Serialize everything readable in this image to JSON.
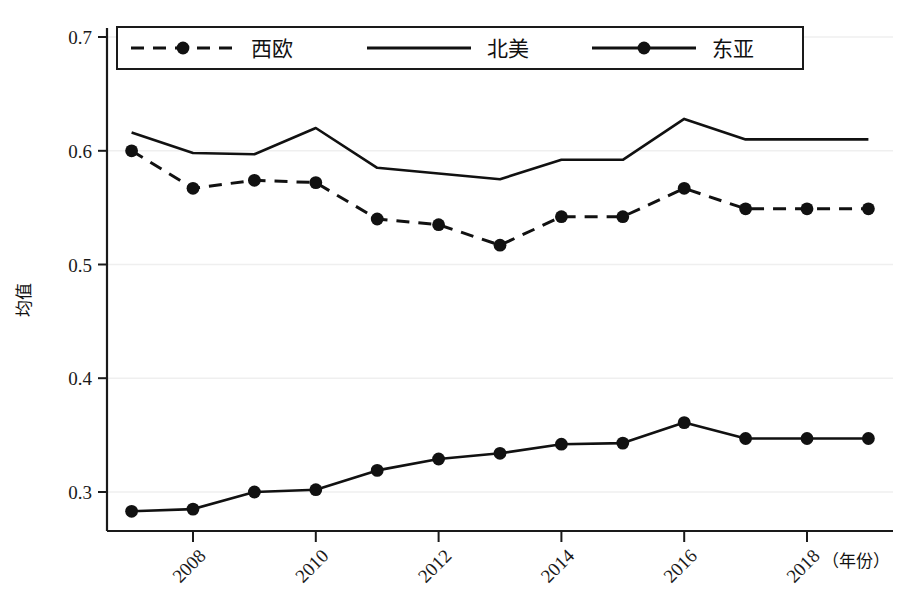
{
  "chart_data": {
    "type": "line",
    "title": "",
    "xlabel": "（年份）",
    "ylabel": "均值",
    "xlim": [
      2006.6,
      2019.4
    ],
    "ylim": [
      0.268,
      0.7
    ],
    "ytick_values": [
      0.3,
      0.4,
      0.5,
      0.6,
      0.7
    ],
    "ytick_labels": [
      "0.3",
      "0.4",
      "0.5",
      "0.6",
      "0.7"
    ],
    "xtick_values": [
      2008,
      2010,
      2012,
      2014,
      2016,
      2018
    ],
    "xtick_labels": [
      "2008",
      "2010",
      "2012",
      "2014",
      "2016",
      "2018"
    ],
    "grid": "horizontal-light",
    "legend_position": "top-inside-boxed",
    "x": [
      2007,
      2008,
      2009,
      2010,
      2011,
      2012,
      2013,
      2014,
      2015,
      2016,
      2017,
      2018,
      2019
    ],
    "series": [
      {
        "name": "西欧",
        "style": "dashed",
        "marker": "filled-circle",
        "color": "#111111",
        "values": [
          0.6,
          0.567,
          0.574,
          0.572,
          0.54,
          0.535,
          0.517,
          0.542,
          0.542,
          0.567,
          0.549,
          0.549,
          0.549
        ],
        "values_plotted": [
          0.6,
          0.567,
          0.574,
          0.572,
          0.54,
          0.535,
          0.517,
          0.542,
          0.542,
          0.567,
          0.549
        ]
      },
      {
        "name": "北美",
        "style": "solid",
        "marker": "none",
        "color": "#111111",
        "values": [
          0.616,
          0.598,
          0.597,
          0.62,
          0.585,
          0.58,
          0.575,
          0.592,
          0.592,
          0.628,
          0.61,
          0.61,
          0.61
        ]
      },
      {
        "name": "东亚",
        "style": "solid",
        "marker": "filled-circle",
        "color": "#111111",
        "values": [
          0.283,
          0.285,
          0.3,
          0.302,
          0.319,
          0.329,
          0.334,
          0.342,
          0.343,
          0.361,
          0.347,
          0.347,
          0.347
        ]
      }
    ]
  },
  "legend": {
    "items": [
      {
        "label": "西欧",
        "style": "dashed-marker"
      },
      {
        "label": "北美",
        "style": "solid"
      },
      {
        "label": "东亚",
        "style": "solid-marker"
      }
    ]
  },
  "axes": {
    "y_title": "均值",
    "x_title": "（年份）",
    "y_ticks": [
      "0.7",
      "0.6",
      "0.5",
      "0.4",
      "0.3"
    ],
    "x_ticks": [
      "2008",
      "2010",
      "2012",
      "2014",
      "2016",
      "2018"
    ]
  },
  "colors": {
    "line": "#111111",
    "grid": "#efefef",
    "axis": "#1a1a1a",
    "background": "#ffffff"
  }
}
